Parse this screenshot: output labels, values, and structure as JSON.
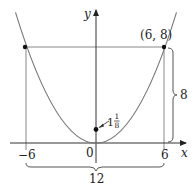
{
  "diagram": {
    "type": "parabola-graph",
    "equation_description": "Parabola with vertex at origin passing through (6, 8) and (-6, 8), focus marked at (0, 1 1/8)",
    "axes": {
      "x_label": "x",
      "y_label": "y"
    },
    "tick_labels": {
      "neg_six": "−6",
      "zero": "0",
      "six": "6"
    },
    "points": {
      "right_top": {
        "label": "(6, 8)",
        "x": 6,
        "y": 8
      },
      "left_top": {
        "label": "",
        "x": -6,
        "y": 8
      },
      "focus": {
        "label_whole": "1",
        "label_num": "1",
        "label_den": "8",
        "x": 0,
        "y": 1.125
      }
    },
    "dimensions": {
      "height_label": "8",
      "width_label": "12"
    },
    "colors": {
      "curve": "#777777",
      "axes": "#333333",
      "lines": "#888888",
      "points": "#111111",
      "text": "#222222"
    }
  }
}
